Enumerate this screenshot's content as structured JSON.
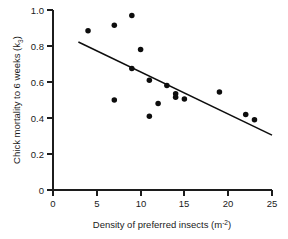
{
  "chart_data": {
    "type": "scatter",
    "title": "",
    "xlabel": "Density of preferred insects (m-2)",
    "xlabel_parts": {
      "main": "Density of preferred insects (m",
      "superscript": "-2",
      "tail": ")"
    },
    "ylabel": "Chick mortality to 6 weeks (k3)",
    "ylabel_parts": {
      "main": "Chick mortality to 6 weeks (k",
      "subscript": "3",
      "tail": ")"
    },
    "xlim": [
      0,
      25
    ],
    "ylim": [
      0,
      1.0
    ],
    "xticks": [
      0,
      5,
      10,
      15,
      20,
      25
    ],
    "xtick_labels": [
      "0",
      "5",
      "10",
      "15",
      "20",
      "25"
    ],
    "yticks": [
      0,
      0.2,
      0.4,
      0.6,
      0.8,
      1.0
    ],
    "ytick_labels": [
      "0",
      "0.2",
      "0.4",
      "0.6",
      "0.8",
      "1.0"
    ],
    "grid": false,
    "legend": null,
    "marker": "filled-circle",
    "marker_color": "#0d0d0d",
    "marker_size": 4.0,
    "x": [
      4.0,
      7.0,
      7.0,
      9.0,
      9.0,
      10.0,
      11.0,
      11.0,
      12.0,
      13.0,
      14.0,
      14.0,
      15.0,
      19.0,
      22.0,
      23.0
    ],
    "y": [
      0.885,
      0.915,
      0.5,
      0.97,
      0.675,
      0.78,
      0.61,
      0.41,
      0.48,
      0.58,
      0.535,
      0.515,
      0.505,
      0.545,
      0.42,
      0.39
    ],
    "points": [
      {
        "x": 4.0,
        "y": 0.885
      },
      {
        "x": 7.0,
        "y": 0.915
      },
      {
        "x": 7.0,
        "y": 0.5
      },
      {
        "x": 9.0,
        "y": 0.97
      },
      {
        "x": 9.0,
        "y": 0.675
      },
      {
        "x": 10.0,
        "y": 0.78
      },
      {
        "x": 11.0,
        "y": 0.61
      },
      {
        "x": 11.0,
        "y": 0.41
      },
      {
        "x": 12.0,
        "y": 0.48
      },
      {
        "x": 13.0,
        "y": 0.58
      },
      {
        "x": 14.0,
        "y": 0.535
      },
      {
        "x": 14.0,
        "y": 0.515
      },
      {
        "x": 15.0,
        "y": 0.505
      },
      {
        "x": 19.0,
        "y": 0.545
      },
      {
        "x": 22.0,
        "y": 0.42
      },
      {
        "x": 23.0,
        "y": 0.39
      }
    ],
    "fit_line": {
      "type": "linear-regression",
      "x_start": 2.9,
      "y_start": 0.822,
      "x_end": 25.0,
      "y_end": 0.305,
      "color": "#0d0d0d"
    }
  }
}
